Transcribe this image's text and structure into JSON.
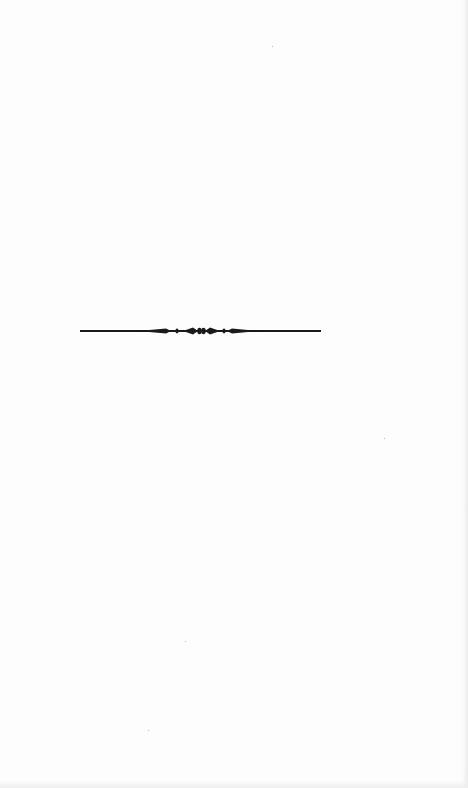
{
  "page": {
    "type": "blank book page",
    "background_color": "#fdfdfd",
    "content_text": ""
  },
  "ornament": {
    "description": "decorative horizontal rule (printer's ornament divider)",
    "color": "#1a1a1a",
    "position_y": 331,
    "x_start": 80,
    "x_end": 321
  }
}
